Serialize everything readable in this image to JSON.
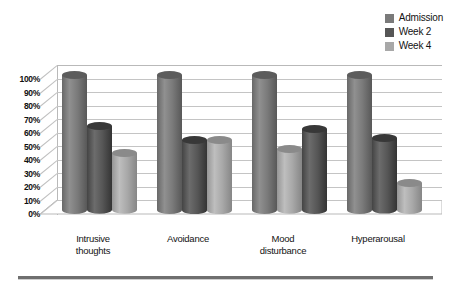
{
  "chart_data": {
    "type": "bar",
    "title": "",
    "subtitle": "",
    "xlabel": "",
    "ylabel": "",
    "ylim": [
      0,
      100
    ],
    "ytick_labels": [
      "100%",
      "90%",
      "80%",
      "70%",
      "60%",
      "50%",
      "40%",
      "30%",
      "20%",
      "10%",
      "0%"
    ],
    "ytick_values": [
      100,
      90,
      80,
      70,
      60,
      50,
      40,
      30,
      20,
      10,
      0
    ],
    "grid": true,
    "legend_position": "top-right",
    "style": "3d-cylinder",
    "categories": [
      "Intrusive thoughts",
      "Avoidance",
      "Mood disturbance",
      "Hyperarousal"
    ],
    "series": [
      {
        "name": "Admission",
        "color": "#7a7a7a",
        "values": [
          100,
          100,
          100,
          100
        ]
      },
      {
        "name": "Week 2",
        "color": "#565656",
        "values": [
          62,
          52,
          45,
          53
        ]
      },
      {
        "name": "Week 4",
        "color": "#a8a8a8",
        "values": [
          42,
          52,
          60,
          20
        ]
      }
    ]
  },
  "legend": {
    "items": [
      {
        "label": "Admission",
        "swatch": "#7a7a7a"
      },
      {
        "label": "Week 2",
        "swatch": "#565656"
      },
      {
        "label": "Week 4",
        "swatch": "#a8a8a8"
      }
    ]
  },
  "axis": {
    "y_ticks": [
      "100%",
      "90%",
      "80%",
      "70%",
      "60%",
      "50%",
      "40%",
      "30%",
      "20%",
      "10%",
      "0%"
    ],
    "x_labels": [
      "Intrusive\nthoughts",
      "Avoidance",
      "Mood\ndisturbance",
      "Hyperarousal"
    ]
  },
  "colors": {
    "admission": "#7a7a7a",
    "week2": "#565656",
    "week4": "#a8a8a8",
    "gridline": "#c4c4c4",
    "frame": "#b9b9b9",
    "rule": "#6f6f6f"
  }
}
